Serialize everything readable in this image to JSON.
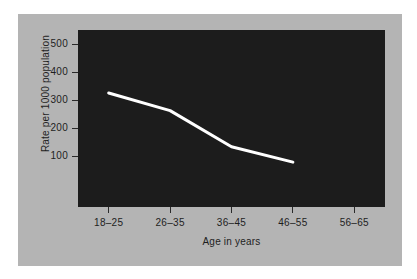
{
  "chart_data": {
    "type": "line",
    "title": "",
    "subtitle": "",
    "xlabel": "Age in years",
    "ylabel": "Rate per 1000 population",
    "categories": [
      "18–25",
      "26–35",
      "36–45",
      "46–55",
      "56–65"
    ],
    "x_tick_labels": [
      "18–25",
      "26–35",
      "36–45",
      "46–55",
      "56–65"
    ],
    "y_tick_labels": [
      "500",
      "400",
      "300",
      "200",
      "100"
    ],
    "y_ticks": [
      500,
      400,
      300,
      200,
      100
    ],
    "ylim": [
      0,
      560
    ],
    "grid": false,
    "legend": false,
    "legend_position": "none",
    "series": [
      {
        "name": "Rate per 1000 population",
        "color": "#ffffff",
        "line_width": 3,
        "markers": false,
        "values": [
          325,
          262,
          133,
          78,
          null
        ],
        "points": [
          {
            "category": "18–25",
            "value": 325
          },
          {
            "category": "26–35",
            "value": 262
          },
          {
            "category": "36–45",
            "value": 133
          },
          {
            "category": "46–55",
            "value": 78
          },
          {
            "category": "56–65",
            "value": null
          }
        ]
      }
    ],
    "plot_background": "#1c1c1c",
    "figure_background": "#b4b4b4",
    "page_background": "#ffffff",
    "annotations": []
  },
  "axes": {
    "y": {
      "title": "Rate per 1000 population",
      "ticks": [
        {
          "label": "500",
          "value": 500
        },
        {
          "label": "400",
          "value": 400
        },
        {
          "label": "300",
          "value": 300
        },
        {
          "label": "200",
          "value": 200
        },
        {
          "label": "100",
          "value": 100
        }
      ]
    },
    "x": {
      "title": "Age in years",
      "ticks": [
        {
          "label": "18–25"
        },
        {
          "label": "26–35"
        },
        {
          "label": "36–45"
        },
        {
          "label": "46–55"
        },
        {
          "label": "56–65"
        }
      ]
    }
  }
}
